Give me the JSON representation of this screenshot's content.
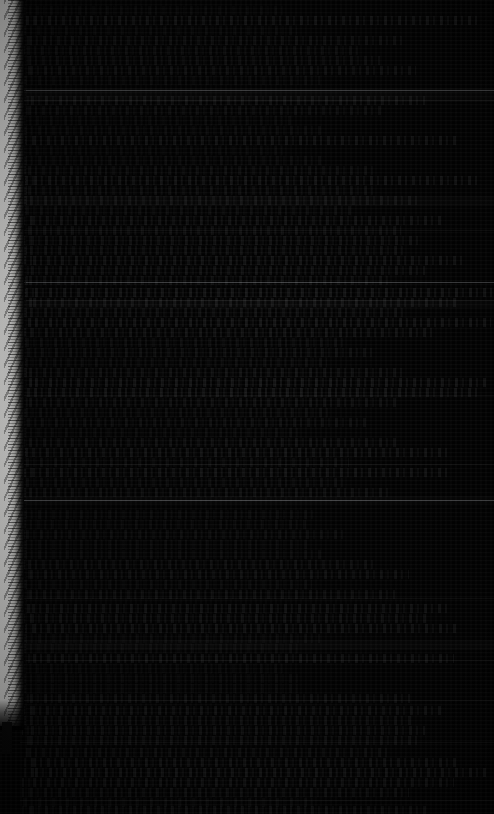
{
  "screen": {
    "width": 494,
    "height": 814,
    "description": "Extremely dark, low-contrast console capture",
    "background_color": "#020202"
  },
  "colors": {
    "background": "#020202",
    "text_dim": "#2a2d30",
    "edge_strip": "#f2f2f0",
    "rule_bright": "#d7dce1",
    "rule_dim": "#969a9f"
  },
  "edge_strip": {
    "label": "left-edge white band",
    "x": 0,
    "width": 24,
    "top": 0,
    "bottom": 726,
    "color": "#f2f2f0"
  },
  "console": {
    "label": "console output region",
    "legible_text": "",
    "note": "No text is legible at any zoom level; content renders as dim monospace rows.",
    "line_rows": [
      6,
      16,
      26,
      36,
      46,
      56,
      66,
      76,
      96,
      106,
      116,
      126,
      136,
      146,
      156,
      166,
      176,
      186,
      196,
      206,
      216,
      226,
      236,
      246,
      256,
      266,
      276,
      288,
      298,
      308,
      318,
      328,
      338,
      348,
      358,
      368,
      378,
      388,
      398,
      408,
      418,
      428,
      438,
      448,
      458,
      468,
      478,
      488,
      510,
      520,
      530,
      540,
      550,
      560,
      570,
      580,
      590,
      604,
      614,
      624,
      634,
      644,
      654,
      664,
      674,
      684,
      694,
      706,
      716,
      726,
      736,
      748,
      758,
      768,
      778,
      788,
      798,
      806
    ],
    "rules": [
      {
        "y": 90,
        "style": "bright"
      },
      {
        "y": 100,
        "style": "dim"
      },
      {
        "y": 230,
        "style": "dim"
      },
      {
        "y": 282,
        "style": "bright"
      },
      {
        "y": 300,
        "style": "dim"
      },
      {
        "y": 395,
        "style": "dim"
      },
      {
        "y": 464,
        "style": "dim"
      },
      {
        "y": 500,
        "style": "bright"
      },
      {
        "y": 598,
        "style": "dim"
      },
      {
        "y": 660,
        "style": "dim"
      },
      {
        "y": 700,
        "style": "dim"
      },
      {
        "y": 742,
        "style": "dim"
      },
      {
        "y": 800,
        "style": "dim"
      }
    ],
    "bands": [
      {
        "y": 88,
        "height": 14
      },
      {
        "y": 196,
        "height": 10
      },
      {
        "y": 300,
        "height": 8
      },
      {
        "y": 496,
        "height": 8
      },
      {
        "y": 640,
        "height": 10
      }
    ]
  }
}
